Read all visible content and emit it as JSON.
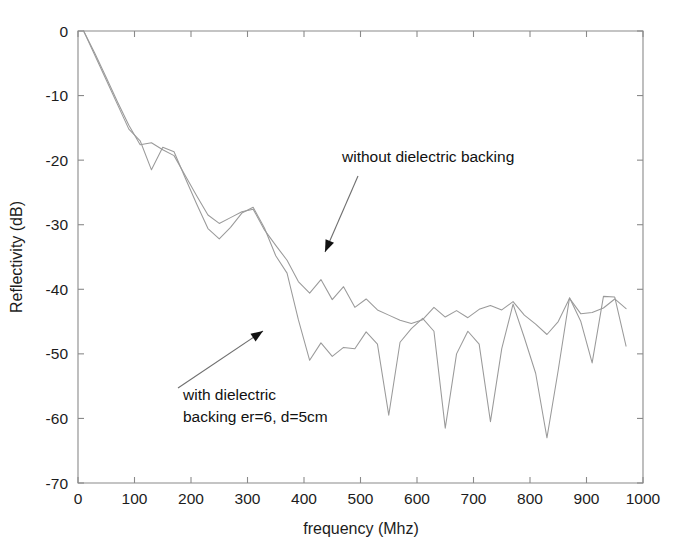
{
  "chart_data": {
    "type": "line",
    "title": "",
    "xlabel": "frequency (Mhz)",
    "ylabel": "Reflectivity (dB)",
    "xlim": [
      0,
      1000
    ],
    "ylim": [
      -70,
      0
    ],
    "xticks": [
      0,
      100,
      200,
      300,
      400,
      500,
      600,
      700,
      800,
      900,
      1000
    ],
    "yticks": [
      0,
      -10,
      -20,
      -30,
      -40,
      -50,
      -60,
      -70
    ],
    "xtick_labels": [
      "0",
      "100",
      "200",
      "300",
      "400",
      "500",
      "600",
      "700",
      "800",
      "900",
      "1000"
    ],
    "ytick_labels": [
      "0",
      "-10",
      "-20",
      "-30",
      "-40",
      "-50",
      "-60",
      "-70"
    ],
    "grid": false,
    "legend_position": "none",
    "line_color": "#9a9a9a",
    "background_color": "#ffffff",
    "series": [
      {
        "name": "without dielectric backing",
        "x": [
          10,
          30,
          50,
          70,
          90,
          110,
          130,
          150,
          170,
          190,
          210,
          230,
          250,
          270,
          290,
          310,
          330,
          350,
          370,
          390,
          410,
          430,
          450,
          470,
          490,
          510,
          530,
          550,
          570,
          590,
          610,
          630,
          650,
          670,
          690,
          710,
          730,
          750,
          770,
          790,
          810,
          830,
          850,
          870,
          890,
          910,
          930,
          950,
          970
        ],
        "values": [
          0,
          -3.5,
          -7.2,
          -11.0,
          -14.6,
          -17.6,
          -17.3,
          -18.4,
          -19.3,
          -22.4,
          -25.5,
          -28.5,
          -29.8,
          -28.9,
          -28.0,
          -27.6,
          -30.8,
          -33.2,
          -35.5,
          -38.8,
          -40.6,
          -38.5,
          -41.6,
          -39.6,
          -42.8,
          -41.5,
          -43.2,
          -44.0,
          -44.8,
          -45.3,
          -44.7,
          -42.8,
          -44.3,
          -43.3,
          -44.4,
          -43.1,
          -42.5,
          -43.2,
          -41.9,
          -44.0,
          -45.4,
          -47.0,
          -45.0,
          -41.4,
          -43.8,
          -43.6,
          -42.9,
          -41.5,
          -43.0
        ]
      },
      {
        "name": "with dielectric backing er=6, d=5cm",
        "x": [
          10,
          30,
          50,
          70,
          90,
          110,
          130,
          150,
          170,
          190,
          210,
          230,
          250,
          270,
          290,
          310,
          330,
          350,
          370,
          390,
          410,
          430,
          450,
          470,
          490,
          510,
          530,
          550,
          570,
          590,
          610,
          630,
          650,
          670,
          690,
          710,
          730,
          750,
          770,
          790,
          810,
          830,
          850,
          870,
          890,
          910,
          930,
          950,
          970
        ],
        "values": [
          0,
          -3.8,
          -7.6,
          -11.4,
          -15.2,
          -17.0,
          -21.5,
          -18.0,
          -18.7,
          -22.8,
          -26.8,
          -30.6,
          -32.2,
          -30.4,
          -28.2,
          -27.3,
          -30.5,
          -34.8,
          -37.5,
          -44.7,
          -51.0,
          -48.3,
          -50.4,
          -49.0,
          -49.2,
          -46.6,
          -48.5,
          -59.5,
          -48.2,
          -46.1,
          -44.5,
          -46.5,
          -61.5,
          -50.0,
          -46.5,
          -48.5,
          -60.5,
          -49.2,
          -42.3,
          -47.5,
          -53.0,
          -63.0,
          -52.5,
          -41.3,
          -45.0,
          -51.4,
          -41.1,
          -41.2,
          -48.8
        ]
      }
    ],
    "annotations": [
      {
        "name": "without-dielectric-backing",
        "text": "without dielectric backing",
        "text_x": 342,
        "text_y": 162,
        "arrow_from_x": 358,
        "arrow_from_y": 176,
        "arrow_to_x": 325,
        "arrow_to_y": 252
      },
      {
        "name": "with-dielectric-backing",
        "line1": "with dielectric",
        "line2": "backing er=6, d=5cm",
        "text_x": 183,
        "text_y": 400,
        "text_y2": 422,
        "arrow_from_x": 178,
        "arrow_from_y": 388,
        "arrow_to_x": 263,
        "arrow_to_y": 331
      }
    ]
  }
}
